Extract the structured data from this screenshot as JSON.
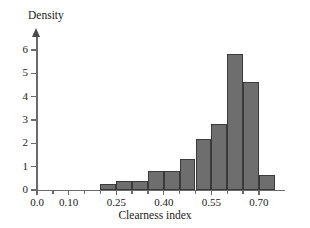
{
  "chart_data": {
    "type": "bar",
    "title": "",
    "subtitle": "",
    "xlabel": "Clearness index",
    "ylabel": "Density",
    "xlim": [
      0.0,
      0.75
    ],
    "ylim": [
      0,
      6.4
    ],
    "grid": false,
    "legend": null,
    "annotations": [],
    "bin_width": 0.05,
    "x_ticks": [
      {
        "value": 0.0,
        "label": "0.0"
      },
      {
        "value": 0.1,
        "label": "0.10"
      },
      {
        "value": 0.25,
        "label": "0.25"
      },
      {
        "value": 0.4,
        "label": "0.40"
      },
      {
        "value": 0.55,
        "label": "0.55"
      },
      {
        "value": 0.7,
        "label": "0.70"
      }
    ],
    "x_minor_ticks": [
      0.05,
      0.15,
      0.2,
      0.3,
      0.35,
      0.45,
      0.5,
      0.6,
      0.65
    ],
    "y_ticks": [
      {
        "value": 0,
        "label": "0"
      },
      {
        "value": 1,
        "label": "1"
      },
      {
        "value": 2,
        "label": "2"
      },
      {
        "value": 3,
        "label": "3"
      },
      {
        "value": 4,
        "label": "4"
      },
      {
        "value": 5,
        "label": "5"
      },
      {
        "value": 6,
        "label": "6"
      }
    ],
    "bars": [
      {
        "bin_start": 0.2,
        "bin_end": 0.25,
        "value": 0.25
      },
      {
        "bin_start": 0.25,
        "bin_end": 0.3,
        "value": 0.4
      },
      {
        "bin_start": 0.3,
        "bin_end": 0.35,
        "value": 0.4
      },
      {
        "bin_start": 0.35,
        "bin_end": 0.4,
        "value": 0.8
      },
      {
        "bin_start": 0.4,
        "bin_end": 0.45,
        "value": 0.8
      },
      {
        "bin_start": 0.45,
        "bin_end": 0.5,
        "value": 1.35
      },
      {
        "bin_start": 0.5,
        "bin_end": 0.55,
        "value": 2.18
      },
      {
        "bin_start": 0.55,
        "bin_end": 0.6,
        "value": 2.85
      },
      {
        "bin_start": 0.6,
        "bin_end": 0.65,
        "value": 5.85
      },
      {
        "bin_start": 0.65,
        "bin_end": 0.7,
        "value": 4.65
      },
      {
        "bin_start": 0.7,
        "bin_end": 0.75,
        "value": 0.65
      }
    ],
    "categories": [
      "0.20-0.25",
      "0.25-0.30",
      "0.30-0.35",
      "0.35-0.40",
      "0.40-0.45",
      "0.45-0.50",
      "0.50-0.55",
      "0.55-0.60",
      "0.60-0.65",
      "0.65-0.70",
      "0.70-0.75"
    ],
    "values": [
      0.25,
      0.4,
      0.4,
      0.8,
      0.8,
      1.35,
      2.18,
      2.85,
      5.85,
      4.65,
      0.65
    ],
    "colors": {
      "bar_fill": "#6e6e6e",
      "bar_edge": "#3a3a3a",
      "axis": "#6a6a6a",
      "text": "#1a1a1a",
      "background": "#ffffff"
    }
  }
}
